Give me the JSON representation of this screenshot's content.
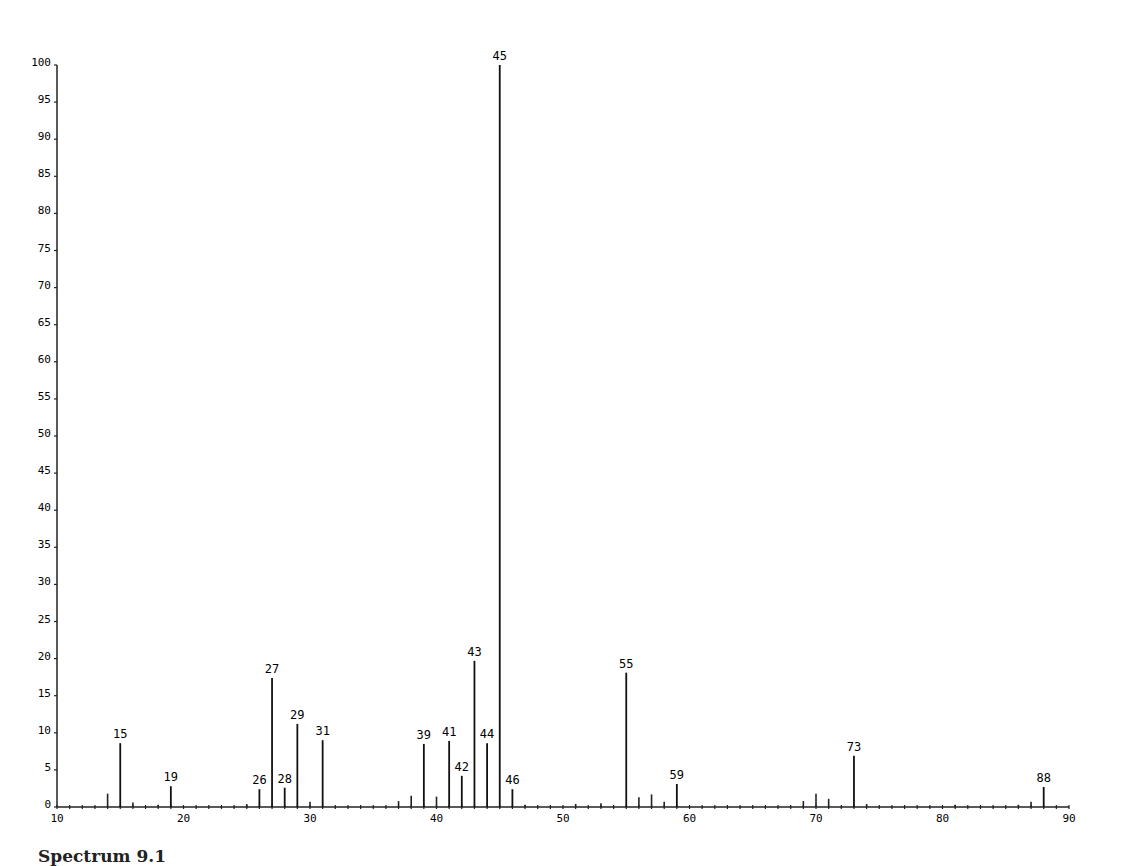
{
  "caption": "Spectrum 9.1",
  "chart_data": {
    "type": "bar",
    "title": "",
    "xlabel": "m/z",
    "ylabel": "Relative abundance (%)",
    "xlim": [
      10,
      90
    ],
    "ylim": [
      0,
      100
    ],
    "grid": false,
    "legend": null,
    "x_ticks": [
      10,
      20,
      30,
      40,
      50,
      60,
      70,
      80,
      90
    ],
    "x_tick_labels": [
      "10",
      "20",
      "30",
      "40",
      "50",
      "60",
      "70",
      "80",
      "90"
    ],
    "y_ticks": [
      0,
      5,
      10,
      15,
      20,
      25,
      30,
      35,
      40,
      45,
      50,
      55,
      60,
      65,
      70,
      75,
      80,
      85,
      90,
      95,
      100
    ],
    "y_tick_labels": [
      "0",
      "5",
      "10",
      "15",
      "20",
      "25",
      "30",
      "35",
      "40",
      "45",
      "50",
      "55",
      "60",
      "65",
      "70",
      "75",
      "80",
      "85",
      "90",
      "95",
      "100"
    ],
    "labeled_peaks": [
      {
        "mz": 15,
        "intensity": 8.6
      },
      {
        "mz": 19,
        "intensity": 2.8
      },
      {
        "mz": 26,
        "intensity": 2.4
      },
      {
        "mz": 27,
        "intensity": 17.4
      },
      {
        "mz": 28,
        "intensity": 2.6
      },
      {
        "mz": 29,
        "intensity": 11.2
      },
      {
        "mz": 31,
        "intensity": 9.0
      },
      {
        "mz": 39,
        "intensity": 8.5
      },
      {
        "mz": 41,
        "intensity": 8.9
      },
      {
        "mz": 42,
        "intensity": 4.2
      },
      {
        "mz": 43,
        "intensity": 19.7
      },
      {
        "mz": 44,
        "intensity": 8.6
      },
      {
        "mz": 45,
        "intensity": 100
      },
      {
        "mz": 46,
        "intensity": 2.4
      },
      {
        "mz": 55,
        "intensity": 18.1
      },
      {
        "mz": 59,
        "intensity": 3.1
      },
      {
        "mz": 73,
        "intensity": 6.9
      },
      {
        "mz": 88,
        "intensity": 2.7
      }
    ],
    "minor_peaks": [
      {
        "mz": 14,
        "intensity": 1.8
      },
      {
        "mz": 16,
        "intensity": 0.6
      },
      {
        "mz": 18,
        "intensity": 0.3
      },
      {
        "mz": 25,
        "intensity": 0.4
      },
      {
        "mz": 30,
        "intensity": 0.7
      },
      {
        "mz": 37,
        "intensity": 0.8
      },
      {
        "mz": 38,
        "intensity": 1.5
      },
      {
        "mz": 40,
        "intensity": 1.4
      },
      {
        "mz": 47,
        "intensity": 0.3
      },
      {
        "mz": 51,
        "intensity": 0.4
      },
      {
        "mz": 53,
        "intensity": 0.5
      },
      {
        "mz": 56,
        "intensity": 1.3
      },
      {
        "mz": 57,
        "intensity": 1.7
      },
      {
        "mz": 58,
        "intensity": 0.7
      },
      {
        "mz": 69,
        "intensity": 0.8
      },
      {
        "mz": 70,
        "intensity": 1.8
      },
      {
        "mz": 71,
        "intensity": 1.1
      },
      {
        "mz": 74,
        "intensity": 0.4
      },
      {
        "mz": 81,
        "intensity": 0.3
      },
      {
        "mz": 86,
        "intensity": 0.3
      },
      {
        "mz": 87,
        "intensity": 0.7
      }
    ]
  }
}
